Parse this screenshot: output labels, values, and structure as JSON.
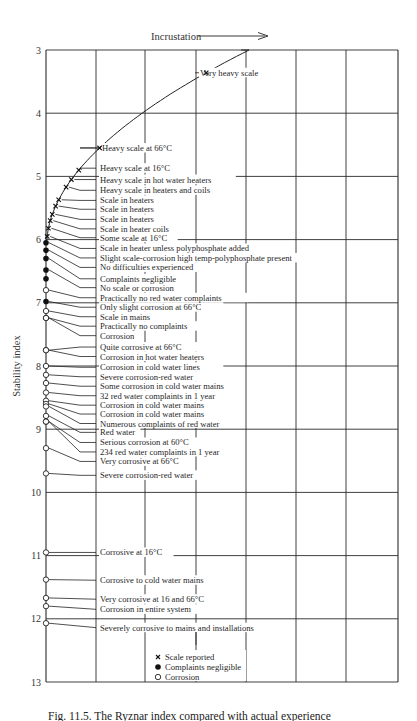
{
  "chart_data": {
    "type": "scatter",
    "title": "Incrustation",
    "title_arrow": "right",
    "xlabel": "",
    "ylabel": "Stability index",
    "ylim": [
      3,
      13
    ],
    "y_inverted": true,
    "y_ticks": [
      "3",
      "4",
      "5",
      "6",
      "7",
      "8",
      "9",
      "10",
      "11",
      "12",
      "13"
    ],
    "grid": true,
    "vertical_gridlines": 6,
    "legend": [
      {
        "symbol": "x",
        "label": "Scale reported"
      },
      {
        "symbol": "filled-circle",
        "label": "Complaints negligible"
      },
      {
        "symbol": "open-circle",
        "label": "Corrosion"
      }
    ],
    "legend_position": "bottom-center",
    "curve": {
      "description": "Incrustation trend curve",
      "from_index": 3.0,
      "to_index": 6.0
    },
    "points": [
      {
        "index": 3.36,
        "symbol": "x",
        "label": "Very heavy scale",
        "label_y": 3.36
      },
      {
        "index": 4.55,
        "symbol": "x",
        "label": "Heavy scale at 66°C",
        "label_y": 4.55
      },
      {
        "index": 4.9,
        "symbol": "x",
        "label": "Heavy scale at 16°C",
        "label_y": 4.87
      },
      {
        "index": 5.05,
        "symbol": "x",
        "label": "Heavy scale in hot water heaters",
        "label_y": 5.05
      },
      {
        "index": 5.17,
        "symbol": "x",
        "label": "Heavy scale in heaters and coils",
        "label_y": 5.22
      },
      {
        "index": 5.37,
        "symbol": "x",
        "label": "Scale in heaters",
        "label_y": 5.38
      },
      {
        "index": 5.47,
        "symbol": "x",
        "label": "Scale in heaters",
        "label_y": 5.52
      },
      {
        "index": 5.6,
        "symbol": "x",
        "label": "Scale in heaters",
        "label_y": 5.68
      },
      {
        "index": 5.7,
        "symbol": "x",
        "label": "Scale in heater coils",
        "label_y": 5.83
      },
      {
        "index": 5.82,
        "symbol": "x",
        "label": "Some scale at 16°C",
        "label_y": 5.97
      },
      {
        "index": 5.95,
        "symbol": "x",
        "label": "Scale in heater unless polyphosphate added",
        "label_y": 6.14
      },
      {
        "index": 6.05,
        "symbol": "filled-circle",
        "label": "Slight scale-corrosion high temp-polyphosphate present",
        "label_y": 6.29
      },
      {
        "index": 6.17,
        "symbol": "filled-circle",
        "label": "No difficulties experienced",
        "label_y": 6.44
      },
      {
        "index": 6.3,
        "symbol": "filled-circle",
        "label": "Complaints negligible",
        "label_y": 6.62
      },
      {
        "index": 6.48,
        "symbol": "filled-circle",
        "label": "No scale or corrosion",
        "label_y": 6.76
      },
      {
        "index": 6.62,
        "symbol": "filled-circle",
        "label": "No scale or corrosion (2)",
        "label_y": null,
        "hidden_label": true
      },
      {
        "index": 6.8,
        "symbol": "open-circle",
        "label": "Practically no red water complaints",
        "label_y": 6.92
      },
      {
        "index": 6.98,
        "symbol": "filled-circle",
        "label": "Only slight corrosion at 66°C",
        "label_y": 7.07
      },
      {
        "index": 7.13,
        "symbol": "open-circle",
        "label": "Scale in mains",
        "label_y": 7.22
      },
      {
        "index": 7.24,
        "symbol": "open-circle",
        "label": "Practically no complaints",
        "label_y": 7.37
      },
      {
        "index": 7.24,
        "symbol": "open-circle",
        "label": "Corrosion",
        "label_y": 7.52
      },
      {
        "index": 7.75,
        "symbol": "open-circle",
        "label": "Quite corrosive at 66°C",
        "label_y": 7.7
      },
      {
        "index": 7.75,
        "symbol": "open-circle",
        "label": "Corrosion in hot water heaters",
        "label_y": 7.85
      },
      {
        "index": 8.0,
        "symbol": "open-circle",
        "label": "Corrosion in cold water lines",
        "label_y": 8.02
      },
      {
        "index": 8.14,
        "symbol": "open-circle",
        "label": "Severe corrosion-red water",
        "label_y": 8.17
      },
      {
        "index": 8.27,
        "symbol": "open-circle",
        "label": "Some corrosion in cold water mains",
        "label_y": 8.32
      },
      {
        "index": 8.42,
        "symbol": "open-circle",
        "label": "32 red water complaints in 1 year",
        "label_y": 8.47
      },
      {
        "index": 8.55,
        "symbol": "open-circle",
        "label": "Corrosion in cold water mains",
        "label_y": 8.62
      },
      {
        "index": 8.6,
        "symbol": "open-circle",
        "label": "Corrosion in cold water mains",
        "label_y": 8.76
      },
      {
        "index": 8.64,
        "symbol": "open-circle",
        "label": "Numerous complaints of red water",
        "label_y": 8.91
      },
      {
        "index": 8.79,
        "symbol": "open-circle",
        "label": "Red water",
        "label_y": 9.05
      },
      {
        "index": 8.88,
        "symbol": "open-circle",
        "label": "Serious corrosion at 60°C",
        "label_y": 9.21
      },
      {
        "index": 8.88,
        "symbol": "open-circle",
        "label": "234 red water complaints in 1 year",
        "label_y": 9.36
      },
      {
        "index": 9.3,
        "symbol": "open-circle",
        "label": "Very corrosive at 66°C",
        "label_y": 9.51
      },
      {
        "index": 9.7,
        "symbol": "open-circle",
        "label": "Severe corrosion-red water",
        "label_y": 9.73
      },
      {
        "index": 10.95,
        "symbol": "open-circle",
        "label": "Corrosive at 16°C",
        "label_y": 10.95
      },
      {
        "index": 11.38,
        "symbol": "open-circle",
        "label": "Corrosive to cold water mains",
        "label_y": 11.39
      },
      {
        "index": 11.67,
        "symbol": "open-circle",
        "label": "Very corrosive at 16 and 66°C",
        "label_y": 11.69
      },
      {
        "index": 11.8,
        "symbol": "open-circle",
        "label": "Corrosion in entire system",
        "label_y": 11.85
      },
      {
        "index": 12.07,
        "symbol": "open-circle",
        "label": "Severely corrosive to mains and installations",
        "label_y": 12.14
      }
    ]
  },
  "caption": "Fig. 11.5. The Ryznar index compared with actual experience"
}
